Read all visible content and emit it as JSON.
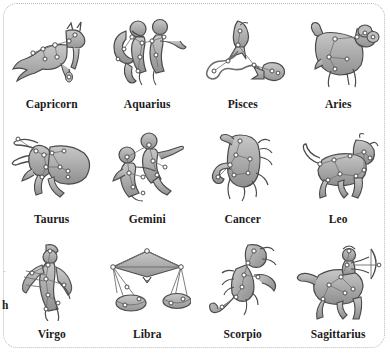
{
  "page": {
    "border_style": "dotted-rounded",
    "border_color": "#b9b9b9",
    "background_color": "#ffffff",
    "columns": 4,
    "rows": 3
  },
  "style": {
    "body_fill_light": "#c4c4c4",
    "body_fill_mid": "#a8a8a8",
    "body_fill_dark": "#8d8d8d",
    "outline_color": "#4a4a4a",
    "star_fill": "#ffffff",
    "star_stroke": "#3c3c3c",
    "line_color": "#6e6e6e",
    "label_color": "#1b1b1b"
  },
  "margin_text": {
    "cut_off_letter": "h",
    "cut_off_mark": "·"
  },
  "signs": [
    {
      "label": "Capricorn",
      "icon": "capricorn-goat-fish-icon",
      "row": 1,
      "col": 1
    },
    {
      "label": "Aquarius",
      "icon": "aquarius-water-bearer-icon",
      "row": 1,
      "col": 2
    },
    {
      "label": "Pisces",
      "icon": "pisces-two-fish-icon",
      "row": 1,
      "col": 3
    },
    {
      "label": "Aries",
      "icon": "aries-ram-icon",
      "row": 1,
      "col": 4
    },
    {
      "label": "Taurus",
      "icon": "taurus-bull-icon",
      "row": 2,
      "col": 1
    },
    {
      "label": "Gemini",
      "icon": "gemini-twins-icon",
      "row": 2,
      "col": 2
    },
    {
      "label": "Cancer",
      "icon": "cancer-crab-icon",
      "row": 2,
      "col": 3
    },
    {
      "label": "Leo",
      "icon": "leo-lion-icon",
      "row": 2,
      "col": 4
    },
    {
      "label": "Virgo",
      "icon": "virgo-maiden-icon",
      "row": 3,
      "col": 1
    },
    {
      "label": "Libra",
      "icon": "libra-scales-icon",
      "row": 3,
      "col": 2
    },
    {
      "label": "Scorpio",
      "icon": "scorpio-scorpion-icon",
      "row": 3,
      "col": 3
    },
    {
      "label": "Sagittarius",
      "icon": "sagittarius-archer-icon",
      "row": 3,
      "col": 4
    }
  ]
}
